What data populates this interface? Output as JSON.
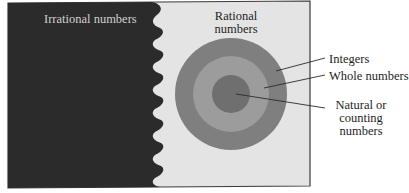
{
  "diagram": {
    "colors": {
      "irrational_region": "#2b2b2b",
      "rational_region": "#e4e4e4",
      "border": "#3a3a3a",
      "integers_ring": "#7f7f7f",
      "whole_ring": "#9c9c9c",
      "natural_disc": "#6f6f6f",
      "leader_line": "#2a2a2a"
    },
    "regions": [
      {
        "id": "irrational",
        "label": "Irrational numbers"
      },
      {
        "id": "rational",
        "label": "Rational numbers"
      }
    ],
    "nested_sets": [
      {
        "id": "integers",
        "label": "Integers"
      },
      {
        "id": "whole",
        "label": "Whole numbers"
      },
      {
        "id": "natural",
        "label": "Natural or counting numbers"
      }
    ]
  }
}
